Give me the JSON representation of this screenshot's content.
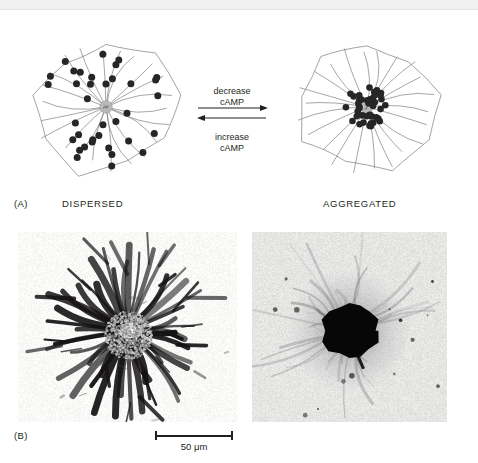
{
  "figure": {
    "type": "scientific-figure"
  },
  "panel_a": {
    "tag": "(A)",
    "left_cell_label": "DISPERSED",
    "right_cell_label": "AGGREGATED",
    "arrow_forward_line1": "decrease",
    "arrow_forward_line2": "cAMP",
    "arrow_reverse_line1": "increase",
    "arrow_reverse_line2": "cAMP",
    "colors": {
      "granule": "#262626",
      "mtoc": "#b9b9b9",
      "microtubule": "#808080",
      "cell_outline": "#8c8c8c",
      "text": "#231f20"
    },
    "left_cell": {
      "state": "dispersed",
      "microtubule_count": 22,
      "granule_count": 36,
      "granule_distribution": "spread along microtubules throughout cytoplasm"
    },
    "right_cell": {
      "state": "aggregated",
      "microtubule_count": 22,
      "granule_count": 42,
      "granule_distribution": "clustered tightly around the central MTOC"
    }
  },
  "panel_b": {
    "tag": "(B)",
    "scale_bar_label": "50 μm",
    "left_micrograph": {
      "caption_state": "dispersed",
      "description": "dark pigment granules spread into radiating dendritic processes"
    },
    "right_micrograph": {
      "caption_state": "aggregated",
      "description": "pigment condensed into a single dense dark mass at cell center"
    }
  }
}
